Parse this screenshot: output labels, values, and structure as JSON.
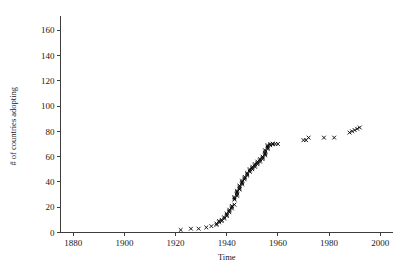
{
  "chart_data": {
    "type": "scatter",
    "title": "",
    "xlabel": "Time",
    "ylabel": "# of countries adopting",
    "xlim": [
      1875,
      2005
    ],
    "ylim": [
      0,
      168
    ],
    "xticks": [
      1880,
      1900,
      1920,
      1940,
      1960,
      1980,
      2000
    ],
    "yticks": [
      0,
      20,
      40,
      60,
      80,
      100,
      120,
      140,
      160
    ],
    "xtick_labels": [
      "1880",
      "1900",
      "1920",
      "1940",
      "1960",
      "1980",
      "2000"
    ],
    "ytick_labels": [
      "0",
      "20",
      "40",
      "60",
      "80",
      "100",
      "120",
      "140",
      "160"
    ],
    "grid": false,
    "legend": null,
    "marker": "x",
    "marker_color": "#000000",
    "series": [
      {
        "name": "cumulative countries adopting",
        "x": [
          1922,
          1926,
          1929,
          1932,
          1934,
          1936,
          1936,
          1937,
          1937,
          1938,
          1938,
          1939,
          1939,
          1940,
          1940,
          1940,
          1941,
          1941,
          1941,
          1942,
          1942,
          1942,
          1943,
          1943,
          1943,
          1943,
          1944,
          1944,
          1944,
          1944,
          1944,
          1945,
          1945,
          1945,
          1945,
          1946,
          1946,
          1946,
          1946,
          1947,
          1947,
          1947,
          1948,
          1948,
          1948,
          1949,
          1949,
          1949,
          1950,
          1950,
          1950,
          1951,
          1951,
          1951,
          1952,
          1952,
          1952,
          1953,
          1953,
          1953,
          1954,
          1954,
          1954,
          1955,
          1955,
          1955,
          1955,
          1955,
          1956,
          1956,
          1956,
          1956,
          1957,
          1957,
          1958,
          1958,
          1959,
          1960,
          1970,
          1971,
          1972,
          1978,
          1982,
          1988,
          1989,
          1990,
          1991,
          1992
        ],
        "y": [
          2,
          3,
          3,
          4,
          5,
          6,
          7,
          8,
          9,
          9,
          10,
          11,
          12,
          13,
          14,
          15,
          16,
          17,
          18,
          19,
          20,
          21,
          22,
          26,
          27,
          28,
          29,
          30,
          31,
          32,
          33,
          34,
          35,
          36,
          37,
          38,
          39,
          40,
          41,
          42,
          43,
          44,
          45,
          46,
          47,
          48,
          49,
          50,
          50,
          51,
          52,
          52,
          53,
          54,
          54,
          55,
          56,
          56,
          57,
          58,
          58,
          59,
          60,
          61,
          62,
          63,
          64,
          65,
          66,
          67,
          68,
          69,
          69,
          70,
          70,
          70,
          70,
          70,
          73,
          73,
          75,
          75,
          75,
          79,
          80,
          81,
          82,
          83
        ]
      }
    ]
  },
  "axes": {
    "x_title": "Time",
    "y_title": "# of countries adopting"
  }
}
